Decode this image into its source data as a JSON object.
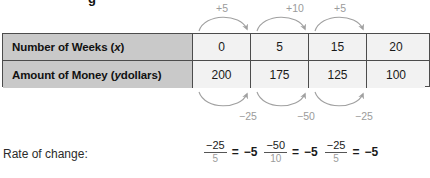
{
  "title_remnant": "g",
  "table": {
    "rows": [
      {
        "label_prefix": "Number of Weeks (",
        "label_var": "x",
        "label_suffix": ")",
        "values": [
          "0",
          "5",
          "15",
          "20"
        ]
      },
      {
        "label_prefix": "Amount of Money (",
        "label_var": "y",
        "label_suffix": " dollars)",
        "values": [
          "200",
          "175",
          "125",
          "100"
        ]
      }
    ]
  },
  "top_arrows": [
    {
      "label": "+5"
    },
    {
      "label": "+10"
    },
    {
      "label": "+5"
    }
  ],
  "bottom_arrows": [
    {
      "label": "−25"
    },
    {
      "label": "−50"
    },
    {
      "label": "−25"
    }
  ],
  "rate_of_change": {
    "label": "Rate of change:",
    "expressions": [
      {
        "numerator": "−25",
        "denominator": "5",
        "equals": "=",
        "value": "−5"
      },
      {
        "numerator": "−50",
        "denominator": "10",
        "equals": "=",
        "value": "−5"
      },
      {
        "numerator": "−25",
        "denominator": "5",
        "equals": "=",
        "value": "−5"
      }
    ]
  },
  "colors": {
    "header_fill": "#c9c9c9",
    "cell_fill": "#f2f2f2",
    "border": "#4c4c4c",
    "arrow": "#a0a0a0",
    "text": "#1a1a1a"
  }
}
